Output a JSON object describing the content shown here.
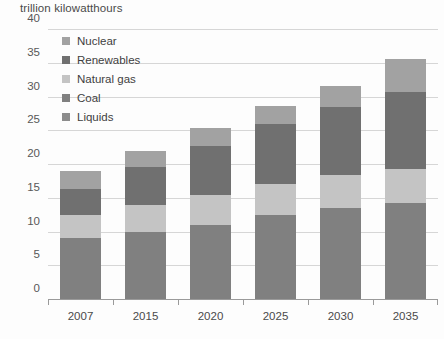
{
  "chart_data": {
    "type": "bar",
    "stacked": true,
    "title": "trillion kilowatthours",
    "xlabel": "",
    "ylabel": "trillion kilowatthours",
    "categories": [
      "2007",
      "2015",
      "2020",
      "2025",
      "2030",
      "2035"
    ],
    "series": [
      {
        "name": "Coal",
        "color": "#808080",
        "values": [
          9.0,
          10.0,
          11.0,
          12.4,
          13.5,
          14.2
        ]
      },
      {
        "name": "Natural gas",
        "color": "#c4c4c4",
        "values": [
          3.4,
          4.0,
          4.4,
          4.6,
          4.8,
          5.0
        ]
      },
      {
        "name": "Renewables",
        "color": "#707070",
        "values": [
          3.9,
          5.5,
          7.3,
          8.9,
          10.2,
          11.4
        ]
      },
      {
        "name": "Nuclear",
        "color": "#a2a2a2",
        "values": [
          2.6,
          2.5,
          2.6,
          2.7,
          3.0,
          4.9
        ]
      }
    ],
    "totals": [
      18.9,
      22.0,
      25.3,
      28.6,
      31.5,
      35.5
    ],
    "ylim": [
      0,
      40
    ],
    "yticks": [
      0,
      5,
      10,
      15,
      20,
      25,
      30,
      35,
      40
    ],
    "ytick_labels": [
      "0",
      "5",
      "10",
      "15",
      "20",
      "25",
      "30",
      "35",
      "40"
    ],
    "grid": true,
    "legend_position": "top-left",
    "legend_order": [
      "Nuclear",
      "Renewables",
      "Natural gas",
      "Coal",
      "Liquids"
    ],
    "legend": [
      {
        "label": "Nuclear",
        "color": "#a2a2a2"
      },
      {
        "label": "Renewables",
        "color": "#707070"
      },
      {
        "label": "Natural gas",
        "color": "#c4c4c4"
      },
      {
        "label": "Coal",
        "color": "#808080"
      },
      {
        "label": "Liquids",
        "color": "#8c8c8c"
      }
    ],
    "colors": {
      "gridline": "#d6d6d6",
      "axis": "#9a9a9a",
      "text": "#4a4a4a",
      "background": "#fdfdfd"
    }
  }
}
